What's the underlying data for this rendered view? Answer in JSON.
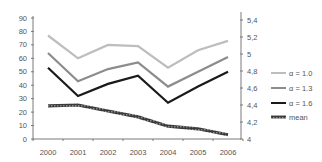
{
  "chart_data": {
    "type": "line",
    "title": "",
    "xlabel": "",
    "ylabel": "",
    "y2label": "",
    "categories": [
      "2000",
      "2001",
      "2002",
      "2003",
      "2004",
      "2005",
      "2006"
    ],
    "ylim": [
      0,
      90
    ],
    "yticks": [
      0,
      10,
      20,
      30,
      40,
      50,
      60,
      70,
      80,
      90
    ],
    "y2lim": [
      4,
      5.4
    ],
    "y2ticks": [
      "4",
      "4,2",
      "4,4",
      "4,6",
      "4,8",
      "5",
      "5,2",
      "5,4"
    ],
    "grid": false,
    "legend_position": "right",
    "series": [
      {
        "name": "α = 1.0",
        "axis": "left",
        "color": "#bdbdbd",
        "values": [
          77,
          60,
          70,
          69,
          53,
          66,
          73
        ]
      },
      {
        "name": "α = 1.3",
        "axis": "left",
        "color": "#8c8c8c",
        "values": [
          64,
          43,
          52,
          57,
          39,
          50,
          61
        ]
      },
      {
        "name": "α = 1.6",
        "axis": "left",
        "color": "#1a1a1a",
        "values": [
          53,
          32,
          41,
          47,
          27,
          39,
          50
        ]
      },
      {
        "name": "mean",
        "axis": "right",
        "color": "#4d4d4d",
        "values": [
          4.39,
          4.4,
          4.33,
          4.26,
          4.15,
          4.12,
          4.05
        ]
      }
    ]
  }
}
